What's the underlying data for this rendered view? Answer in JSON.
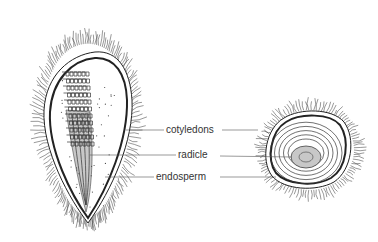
{
  "diagram": {
    "title": "",
    "labels": [
      {
        "id": "cotyledons",
        "text": "cotyledons"
      },
      {
        "id": "radicle",
        "text": "radicle"
      },
      {
        "id": "endosperm",
        "text": "endosperm"
      }
    ],
    "views": [
      "longitudinal-section",
      "transverse-section"
    ],
    "colors": {
      "ink": "#222222",
      "shade": "#c8c8c8",
      "background": "#ffffff"
    }
  }
}
